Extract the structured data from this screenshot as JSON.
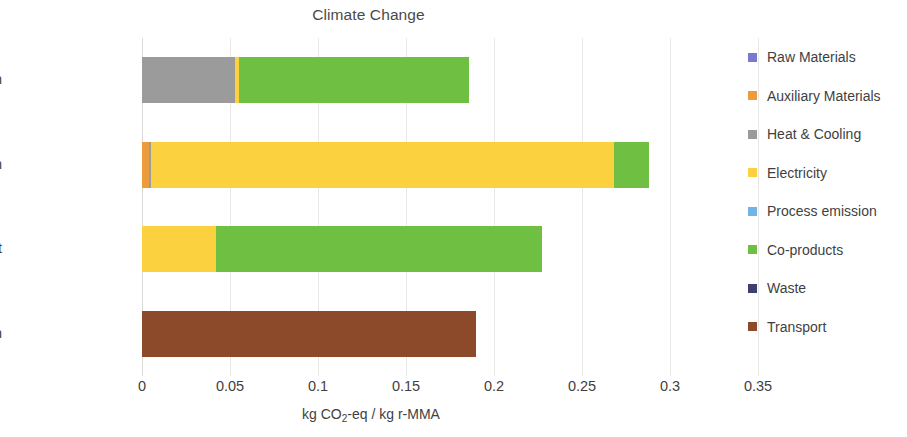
{
  "chart_data": {
    "type": "bar",
    "orientation": "horizontal",
    "stacked": true,
    "title": "Climate Change",
    "xlabel": "kg CO2-eq / kg r-MMA",
    "xlabel_parts": {
      "pre": "kg CO",
      "sub": "2",
      "post": "-eq / kg r-MMA"
    },
    "ylabel": "",
    "categories": [
      "Purification",
      "Depolymerization",
      "Pretreatment",
      "Collection"
    ],
    "xlim": [
      0,
      0.35
    ],
    "xticks": [
      0,
      0.05,
      0.1,
      0.15,
      0.2,
      0.25,
      0.3,
      0.35
    ],
    "xtick_labels": [
      "0",
      "0.05",
      "0.1",
      "0.15",
      "0.2",
      "0.25",
      "0.3",
      "0.35"
    ],
    "grid": true,
    "grid_axis": "x",
    "legend_position": "right",
    "series": [
      {
        "name": "Raw Materials",
        "color": "#7A79D2",
        "values": [
          0,
          0,
          0,
          0
        ]
      },
      {
        "name": "Auxiliary Materials",
        "color": "#ED9C3B",
        "values": [
          0,
          0.004,
          0,
          0
        ]
      },
      {
        "name": "Heat & Cooling",
        "color": "#9B9B9B",
        "values": [
          0.053,
          0.001,
          0,
          0
        ]
      },
      {
        "name": "Electricity",
        "color": "#FBD13F",
        "values": [
          0.002,
          0.263,
          0.042,
          0
        ]
      },
      {
        "name": "Process emission",
        "color": "#6FB4E3",
        "values": [
          0,
          0,
          0,
          0
        ]
      },
      {
        "name": "Co-products",
        "color": "#6FBF43",
        "values": [
          0.131,
          0.02,
          0.185,
          0
        ]
      },
      {
        "name": "Waste",
        "color": "#3F3F6E",
        "values": [
          0,
          0,
          0,
          0
        ]
      },
      {
        "name": "Transport",
        "color": "#8C4A2A",
        "values": [
          0,
          0,
          0,
          0.19
        ]
      }
    ],
    "totals": [
      0.186,
      0.288,
      0.227,
      0.19
    ]
  }
}
